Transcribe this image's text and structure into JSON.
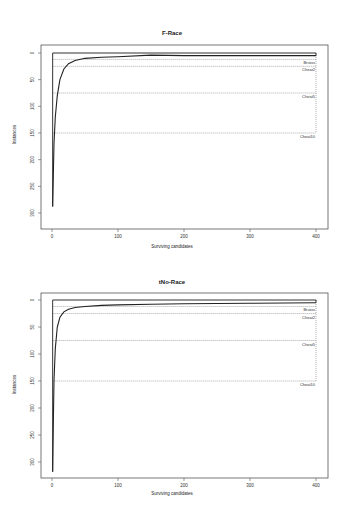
{
  "chart_data": [
    {
      "type": "line",
      "title": "F-Race",
      "xlabel": "Surviving candidates",
      "ylabel": "Instances",
      "xlim": [
        0,
        400
      ],
      "ylim": [
        0,
        320
      ],
      "y_reversed": true,
      "xticks": [
        0,
        100,
        200,
        300,
        400
      ],
      "yticks": [
        0,
        50,
        100,
        150,
        200,
        250,
        300
      ],
      "grid": false,
      "series": [
        {
          "name": "F-Race curve",
          "x": [
            1,
            2,
            3,
            5,
            8,
            12,
            18,
            25,
            35,
            50,
            75,
            100,
            150,
            200,
            300,
            400
          ],
          "y": [
            288,
            230,
            170,
            120,
            80,
            50,
            30,
            20,
            14,
            10,
            8,
            7,
            4,
            5,
            5,
            5
          ]
        },
        {
          "name": "Total instances (upper bound)",
          "x": [
            1,
            400
          ],
          "y": [
            0,
            0
          ]
        }
      ],
      "reference_lines": [
        {
          "label": "Brutus",
          "y": 12
        },
        {
          "label": "Cheat2",
          "y": 25
        },
        {
          "label": "Cheat5",
          "y": 75
        },
        {
          "label": "Cheat10",
          "y": 150
        }
      ]
    },
    {
      "type": "line",
      "title": "tNo-Race",
      "xlabel": "Surviving candidates",
      "ylabel": "Instances",
      "xlim": [
        0,
        400
      ],
      "ylim": [
        0,
        320
      ],
      "y_reversed": true,
      "xticks": [
        0,
        100,
        200,
        300,
        400
      ],
      "yticks": [
        0,
        50,
        100,
        150,
        200,
        250,
        300
      ],
      "grid": false,
      "series": [
        {
          "name": "tNo-Race curve",
          "x": [
            1,
            2,
            3,
            5,
            8,
            12,
            18,
            25,
            35,
            50,
            75,
            100,
            150,
            200,
            300,
            400
          ],
          "y": [
            318,
            230,
            150,
            90,
            50,
            32,
            22,
            17,
            14,
            12,
            10,
            9,
            8,
            7,
            6,
            5
          ]
        },
        {
          "name": "Total instances (upper bound)",
          "x": [
            1,
            400
          ],
          "y": [
            0,
            0
          ]
        }
      ],
      "reference_lines": [
        {
          "label": "Brutus",
          "y": 12
        },
        {
          "label": "Cheat2",
          "y": 25
        },
        {
          "label": "Cheat5",
          "y": 75
        },
        {
          "label": "Cheat10",
          "y": 150
        }
      ]
    }
  ],
  "panels": [
    {
      "title": "F-Race",
      "xlabel": "Surviving candidates",
      "ylabel": "Instances"
    },
    {
      "title": "tNo-Race",
      "xlabel": "Surviving candidates",
      "ylabel": "Instances"
    }
  ]
}
